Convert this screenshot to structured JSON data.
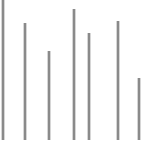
{
  "chart_data": {
    "type": "bar",
    "title": "",
    "subtitle": "",
    "xlabel": "",
    "ylabel": "",
    "categories": [
      "1",
      "2",
      "3",
      "4",
      "5",
      "6",
      "7"
    ],
    "values": [
      140,
      117,
      89,
      131,
      107,
      119,
      62
    ],
    "bar_x_positions": [
      2,
      24,
      48,
      73,
      88,
      117,
      138
    ],
    "bar_width_px": 2,
    "baseline_y_px": 140,
    "ylim": [
      0,
      140
    ],
    "grid": false,
    "legend": null,
    "legend_position": "none",
    "tick_labels_x": [],
    "tick_labels_y": [],
    "annotations": [],
    "colors": {
      "bar": "#8a8a8a",
      "background": "#ffffff"
    }
  },
  "canvas": {
    "width": 156,
    "height": 149
  }
}
